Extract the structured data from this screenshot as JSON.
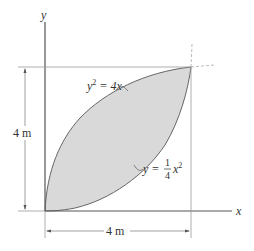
{
  "figure": {
    "axis_x_label": "x",
    "axis_y_label": "y",
    "curve_upper": {
      "lhs": "y",
      "exp": "2",
      "rhs": " = 4x"
    },
    "curve_lower": {
      "lhs": "y = ",
      "num": "1",
      "den": "4",
      "var": "x",
      "exp": "2"
    },
    "dim_height": "4 m",
    "dim_width": "4 m",
    "colors": {
      "fill": "#d9d9d9",
      "stroke": "#666666",
      "line": "#888888"
    }
  }
}
